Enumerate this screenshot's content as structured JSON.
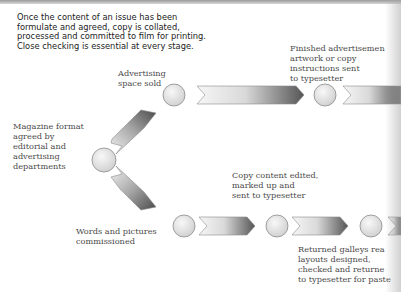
{
  "intro_text": "Once the content of an issue has been formulate and agreed, copy is collated, processed and committed to film for printing. Close checking is essential at every stage.",
  "labels": {
    "magazine_format": "Magazine format\nagreed  by\neditorial and\nadvertising\ndepartments",
    "advertising_space": "Advertising\nspace sold",
    "finished_ads": "Finished advertisemen\nartwork or copy\ninstructions sent\nto typesetter",
    "copy_edited": "Copy content edited,\nmarked up and\nsent to typesetter",
    "words_pictures": "Words and pictures\ncommissioned",
    "returned_galleys": "Returned galleys rea\nlayouts designed,\nchecked and returne\nto typesetter for paste"
  },
  "colors": {
    "arrow_light": "#f4f4f4",
    "arrow_dark": "#5a5a5a",
    "stroke": "#8a8a8a",
    "circle_fill": "#e6e6e6"
  }
}
